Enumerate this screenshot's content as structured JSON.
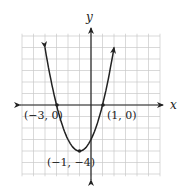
{
  "chart_data": {
    "type": "line",
    "title": "",
    "xlabel": "x",
    "ylabel": "y",
    "xlim": [
      -6,
      6
    ],
    "ylim": [
      -6,
      6
    ],
    "grid": true,
    "function": "y = (x + 1)^2 - 4",
    "series": [
      {
        "name": "parabola",
        "x": [
          -4.3,
          -4,
          -3,
          -2,
          -1,
          0,
          1,
          2,
          2.3
        ],
        "values": [
          6.89,
          5,
          0,
          -3,
          -4,
          -3,
          0,
          5,
          6.89
        ]
      }
    ],
    "points": [
      {
        "label": "(−3, 0)",
        "x": -3,
        "y": 0
      },
      {
        "label": "(1, 0)",
        "x": 1,
        "y": 0
      },
      {
        "label": "(−1, −4)",
        "x": -1,
        "y": -4
      }
    ]
  },
  "labels": {
    "x_axis": "x",
    "y_axis": "y",
    "p1": "(−3, 0)",
    "p2": "(1, 0)",
    "p3": "(−1, −4)"
  }
}
